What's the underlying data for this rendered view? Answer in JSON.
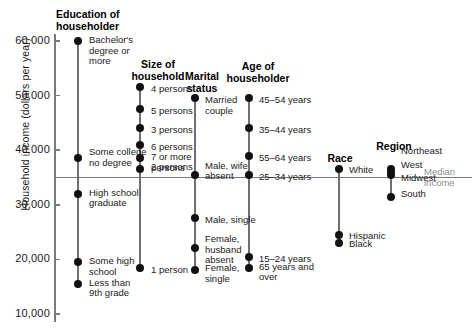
{
  "chart_data": {
    "type": "scatter",
    "title": "",
    "ylabel": "Household income (dollars per year)",
    "xlabel": "",
    "ylim": [
      10000,
      62000
    ],
    "yticks": [
      10000,
      20000,
      30000,
      40000,
      50000,
      60000
    ],
    "ytick_labels": [
      "10,000",
      "20,000",
      "30,000",
      "40,000",
      "50,000",
      "60,000"
    ],
    "grid": false,
    "legend": "none",
    "reference_line": {
      "label": "Median\nincome",
      "value": 35000
    },
    "colors": {
      "dot": "#111111",
      "stem": "#6f6f6f",
      "axis": "#7a7a7a",
      "median_text": "#8c8c8c"
    },
    "series": [
      {
        "name": "Education of\nhouseholder",
        "categories": [
          {
            "label": "Bachelor's\ndegree or\nmore",
            "value": 60000
          },
          {
            "label": "Some college\nno degree",
            "value": 38500
          },
          {
            "label": "High school\ngraduate",
            "value": 32000
          },
          {
            "label": "Some high\nschool",
            "value": 19500
          },
          {
            "label": "Less than\n9th grade",
            "value": 15500
          }
        ]
      },
      {
        "name": "Size of\nhousehold",
        "categories": [
          {
            "label": "4 persons",
            "value": 51500
          },
          {
            "label": "5 persons",
            "value": 47500
          },
          {
            "label": "3 persons",
            "value": 44000
          },
          {
            "label": "6 persons",
            "value": 41000
          },
          {
            "label": "7 or more\npersons",
            "value": 38500
          },
          {
            "label": "2 persons",
            "value": 36500
          },
          {
            "label": "1 person",
            "value": 18500
          }
        ]
      },
      {
        "name": "Marital\nstatus",
        "categories": [
          {
            "label": "Married\ncouple",
            "value": 49500
          },
          {
            "label": "Male, wife\nabsent",
            "value": 35500
          },
          {
            "label": "Male, single",
            "value": 27500
          },
          {
            "label": "Female,\nhusband\nabsent",
            "value": 22000
          },
          {
            "label": "Female,\nsingle",
            "value": 18000
          }
        ]
      },
      {
        "name": "Age of\nhouseholder",
        "categories": [
          {
            "label": "45–54 years",
            "value": 49500
          },
          {
            "label": "35–44 years",
            "value": 44000
          },
          {
            "label": "55–64 years",
            "value": 39000
          },
          {
            "label": "25–34 years",
            "value": 35500
          },
          {
            "label": "15–24 years",
            "value": 20500
          },
          {
            "label": "65 years and\nover",
            "value": 18500
          }
        ]
      },
      {
        "name": "Race",
        "categories": [
          {
            "label": "White",
            "value": 36500
          },
          {
            "label": "Hispanic",
            "value": 24500
          },
          {
            "label": "Black",
            "value": 23000
          }
        ]
      },
      {
        "name": "Region",
        "categories": [
          {
            "label": "Northeast",
            "value": 36500
          },
          {
            "label": "West",
            "value": 36000
          },
          {
            "label": "Midwest",
            "value": 35500
          },
          {
            "label": "South",
            "value": 31500
          }
        ]
      }
    ]
  }
}
